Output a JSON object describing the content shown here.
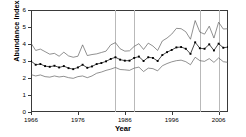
{
  "chart_data": {
    "type": "line",
    "title": "",
    "xlabel": "Year",
    "ylabel": "Abundance Index",
    "xlim": [
      1966,
      2008
    ],
    "ylim": [
      0,
      6
    ],
    "xticks": [
      1966,
      1976,
      1986,
      1996,
      2006
    ],
    "yticks": [
      0,
      1,
      2,
      3,
      4,
      5,
      6
    ],
    "xtick_labels": [
      "1966",
      "1976",
      "1986",
      "1996",
      "2006"
    ],
    "ytick_labels": [
      "0",
      "1",
      "2",
      "3",
      "4",
      "5",
      "6"
    ],
    "grid": "vertical-only",
    "gridlines_x": [
      1984,
      1988,
      2002,
      2006
    ],
    "legend": "none",
    "colors": {
      "axis": "#3a3a3a",
      "gridline": "#b9b9b9",
      "index_line": "#1a1a1a",
      "marker": "#000000",
      "ci_line": "#555555"
    },
    "x": [
      1966,
      1967,
      1968,
      1969,
      1970,
      1971,
      1972,
      1973,
      1974,
      1975,
      1976,
      1977,
      1978,
      1979,
      1980,
      1981,
      1982,
      1983,
      1984,
      1985,
      1986,
      1987,
      1988,
      1989,
      1990,
      1991,
      1992,
      1993,
      1994,
      1995,
      1996,
      1997,
      1998,
      1999,
      2000,
      2001,
      2002,
      2003,
      2004,
      2005,
      2006,
      2007,
      2008
    ],
    "series": [
      {
        "name": "Upper confidence limit",
        "style": "thin-line",
        "values": [
          4.05,
          3.62,
          3.7,
          3.55,
          3.4,
          3.45,
          3.28,
          3.52,
          3.3,
          3.22,
          3.28,
          3.95,
          3.32,
          3.38,
          3.42,
          3.5,
          3.58,
          3.95,
          4.08,
          3.72,
          3.58,
          3.6,
          3.86,
          4.02,
          3.68,
          4.05,
          3.88,
          3.62,
          4.18,
          4.35,
          4.58,
          4.92,
          4.9,
          4.72,
          4.28,
          5.38,
          4.7,
          4.58,
          5.05,
          4.35,
          5.28,
          4.88,
          4.9
        ]
      },
      {
        "name": "Abundance index",
        "style": "line-with-square-markers",
        "values": [
          3.0,
          2.78,
          2.82,
          2.7,
          2.66,
          2.72,
          2.62,
          2.7,
          2.58,
          2.52,
          2.62,
          2.78,
          2.6,
          2.68,
          2.82,
          2.88,
          2.98,
          3.12,
          3.22,
          3.08,
          3.02,
          3.02,
          3.18,
          3.26,
          3.0,
          3.22,
          3.18,
          3.0,
          3.35,
          3.52,
          3.65,
          3.8,
          3.82,
          3.72,
          3.42,
          4.1,
          3.75,
          3.72,
          3.98,
          3.62,
          4.02,
          3.78,
          3.82
        ]
      },
      {
        "name": "Lower confidence limit",
        "style": "thin-line",
        "values": [
          2.2,
          2.12,
          2.18,
          2.08,
          2.05,
          2.12,
          2.06,
          2.1,
          2.02,
          1.98,
          2.08,
          2.12,
          2.02,
          2.12,
          2.28,
          2.35,
          2.45,
          2.52,
          2.62,
          2.5,
          2.48,
          2.45,
          2.58,
          2.64,
          2.38,
          2.58,
          2.55,
          2.42,
          2.72,
          2.85,
          2.95,
          3.02,
          3.05,
          2.96,
          2.78,
          3.22,
          3.02,
          2.98,
          3.14,
          2.92,
          3.18,
          2.96,
          2.92
        ]
      }
    ]
  }
}
